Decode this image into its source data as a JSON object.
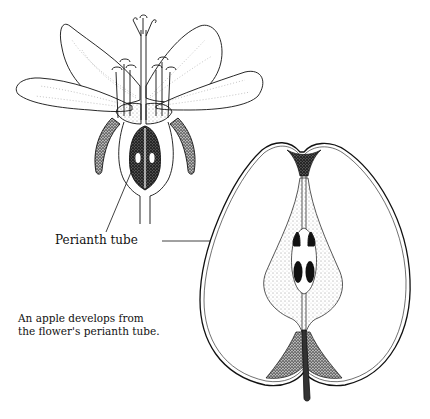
{
  "figure": {
    "parts": [
      {
        "name": "flower",
        "view": "longitudinal section",
        "elements": [
          "petals",
          "stigmas",
          "style",
          "stamens",
          "sepals",
          "ovary with ovules",
          "perianth tube",
          "pedicel"
        ]
      },
      {
        "name": "apple",
        "view": "longitudinal section",
        "elements": [
          "skin",
          "calyx end",
          "core",
          "seeds",
          "stem cavity",
          "stem"
        ]
      }
    ]
  },
  "labels": {
    "perianth_tube": "Perianth tube"
  },
  "caption": {
    "line1": "An apple develops from",
    "line2": "the flower's perianth tube."
  },
  "colors": {
    "ink": "#111111",
    "background": "#ffffff"
  }
}
